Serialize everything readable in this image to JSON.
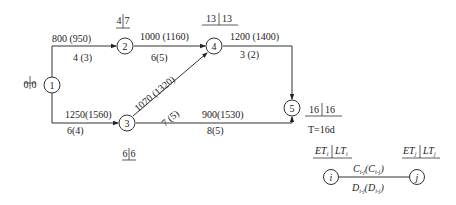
{
  "nodes": [
    {
      "id": "1",
      "label": "1",
      "et": "0",
      "lt": "0"
    },
    {
      "id": "2",
      "label": "2",
      "et": "4",
      "lt": "7"
    },
    {
      "id": "3",
      "label": "3",
      "et": "6",
      "lt": "6"
    },
    {
      "id": "4",
      "label": "4",
      "et": "13",
      "lt": "13"
    },
    {
      "id": "5",
      "label": "5",
      "et": "16",
      "lt": "16"
    }
  ],
  "edges": [
    {
      "from": "1",
      "to": "2",
      "cost": "800 (950)",
      "duration": "4 (3)"
    },
    {
      "from": "1",
      "to": "3",
      "cost": "1250(1560)",
      "duration": "6(4)"
    },
    {
      "from": "2",
      "to": "4",
      "cost": "1000 (1160)",
      "duration": "6(5)"
    },
    {
      "from": "3",
      "to": "4",
      "cost": "1070 (1320)",
      "duration": "7 (5)"
    },
    {
      "from": "4",
      "to": "5",
      "cost": "1200 (1400)",
      "duration": "3 (2)"
    },
    {
      "from": "3",
      "to": "5",
      "cost": "900(1530)",
      "duration": "8(5)"
    }
  ],
  "total_time": "T=16d",
  "legend": {
    "node_i": "i",
    "node_j": "j",
    "et_i": "ET",
    "lt_i": "LT",
    "et_j": "ET",
    "lt_j": "LT",
    "sub_i": "i",
    "sub_j": "j",
    "cost_label": "C",
    "cost_sub": "i-j",
    "cost_paren_sub": "i-j",
    "dur_label": "D",
    "dur_sub": "i-j",
    "dur_paren_sub": "i-j"
  }
}
